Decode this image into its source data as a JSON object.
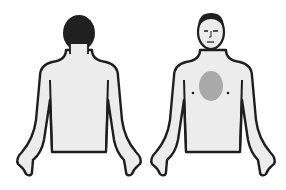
{
  "figures": [
    {
      "view": "back",
      "label": ""
    },
    {
      "view": "front",
      "label": ""
    }
  ],
  "colors": {
    "background": "#ffffff",
    "skin": "#ececec",
    "outline": "#1e1e1e",
    "hair": "#202020",
    "pain_region": "#a9a9a9"
  },
  "pain_region": {
    "location": "center-chest",
    "shape": "ellipse"
  }
}
